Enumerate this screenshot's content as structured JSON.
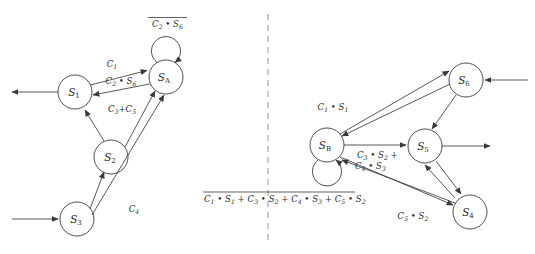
{
  "figure": {
    "title": "",
    "type": "state-transition-diagram-pair",
    "divider": "vertical-dashed-line"
  },
  "left_diagram": {
    "name": "left-state-machine",
    "nodes": [
      {
        "id": "S1",
        "label_base": "S",
        "label_sub": "1",
        "cx": 75,
        "cy": 92,
        "r": 17
      },
      {
        "id": "SA",
        "label_base": "S",
        "label_sub": "A",
        "cx": 166,
        "cy": 77,
        "r": 17
      },
      {
        "id": "S2",
        "label_base": "S",
        "label_sub": "2",
        "cx": 111,
        "cy": 157,
        "r": 17
      },
      {
        "id": "S3",
        "label_base": "S",
        "label_sub": "3",
        "cx": 77,
        "cy": 219,
        "r": 17
      }
    ],
    "self_loop": {
      "on": "SA",
      "label_overlined": true,
      "label_parts": [
        "C",
        "2",
        " • ",
        "S",
        "6"
      ],
      "label_text": "C2 • S6"
    },
    "edge_labels": {
      "s1_to_sa": {
        "text": "C1",
        "base": "C",
        "sub": "1"
      },
      "sa_to_s1": {
        "base1": "C",
        "sub1": "2",
        "op": " • ",
        "base2": "S",
        "sub2": "6"
      },
      "s2_to_s1": {
        "base1": "C",
        "sub1": "3",
        "op": "+",
        "base2": "C",
        "sub2": "5"
      },
      "s3_to_sa": {
        "base": "C",
        "sub": "4"
      }
    },
    "external_arrows": [
      {
        "name": "s1-output-arrow",
        "direction": "left-out"
      },
      {
        "name": "s3-input-arrow",
        "direction": "right-in"
      }
    ]
  },
  "right_diagram": {
    "name": "right-state-machine",
    "nodes": [
      {
        "id": "SB",
        "label_base": "S",
        "label_sub": "B",
        "cx": 327,
        "cy": 145,
        "r": 17
      },
      {
        "id": "S6",
        "label_base": "S",
        "label_sub": "6",
        "cx": 466,
        "cy": 80,
        "r": 17
      },
      {
        "id": "S5",
        "label_base": "S",
        "label_sub": "5",
        "cx": 425,
        "cy": 146,
        "r": 17
      },
      {
        "id": "S4",
        "label_base": "S",
        "label_sub": "4",
        "cx": 470,
        "cy": 212,
        "r": 17
      }
    ],
    "self_loop": {
      "on": "SB",
      "label_overlined": true,
      "label_text": "C1 • S1 + C3 • S2 + C4 • S3 + C5 • S2"
    },
    "edge_labels": {
      "s6_to_sb": {
        "base1": "C",
        "sub1": "1",
        "op": " • ",
        "base2": "S",
        "sub2": "1"
      },
      "sb_to_s5_line1": {
        "base1": "C",
        "sub1": "3",
        "op": " • ",
        "base2": "S",
        "sub2": "2",
        "trail": " +"
      },
      "sb_to_s5_line2": {
        "base1": "C",
        "sub1": "4",
        "op": " • ",
        "base2": "S",
        "sub2": "3"
      },
      "sb_to_s4": {
        "base1": "C",
        "sub1": "5",
        "op": " • ",
        "base2": "S",
        "sub2": "2"
      }
    },
    "external_arrows": [
      {
        "name": "s6-input-arrow",
        "direction": "left-in"
      },
      {
        "name": "s5-output-arrow",
        "direction": "right-out"
      }
    ]
  },
  "colors": {
    "stroke": "#3a3a3a",
    "text": "#2b2b2b",
    "divider": "#9a9a9a",
    "background": "#ffffff"
  }
}
